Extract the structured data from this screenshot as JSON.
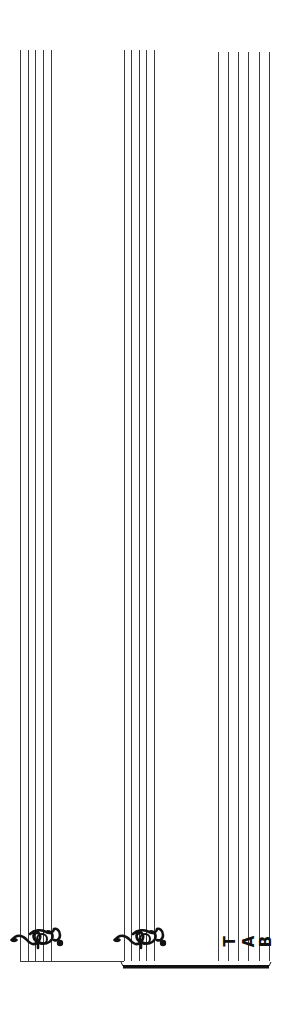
{
  "page": {
    "orientation": "rotated-90",
    "staves": [
      {
        "id": "staff-1",
        "type": "standard",
        "clef": "treble-clef",
        "lines": 5
      },
      {
        "id": "staff-2",
        "type": "standard",
        "clef": "treble-clef",
        "lines": 5
      },
      {
        "id": "staff-tab",
        "type": "tablature",
        "clef": "tab-clef",
        "lines": 6
      }
    ],
    "tab_clef": {
      "t": "T",
      "a": "A",
      "b": "B"
    },
    "colors": {
      "line": "#3a3a3a",
      "ink": "#111111",
      "background": "#ffffff"
    }
  }
}
